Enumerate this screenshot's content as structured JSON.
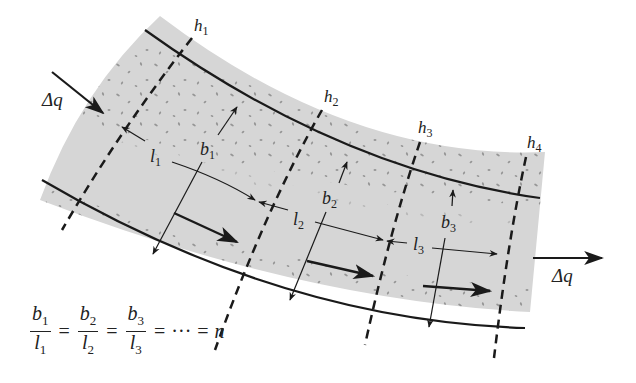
{
  "figure": {
    "type": "flow-net-element",
    "colors": {
      "soil_fill": "#d4d4d4",
      "speckle": "#8a8a8a",
      "line": "#1a1a1a",
      "background": "#ffffff"
    },
    "equipotential_labels": [
      {
        "base": "h",
        "sub": "1"
      },
      {
        "base": "h",
        "sub": "2"
      },
      {
        "base": "h",
        "sub": "3"
      },
      {
        "base": "h",
        "sub": "4"
      }
    ],
    "length_labels": [
      {
        "base": "l",
        "sub": "1"
      },
      {
        "base": "l",
        "sub": "2"
      },
      {
        "base": "l",
        "sub": "3"
      }
    ],
    "width_labels": [
      {
        "base": "b",
        "sub": "1"
      },
      {
        "base": "b",
        "sub": "2"
      },
      {
        "base": "b",
        "sub": "3"
      }
    ],
    "flow_in_label": "Δq",
    "flow_out_label": "Δq"
  },
  "equation": {
    "fractions": [
      {
        "num": "b",
        "num_sub": "1",
        "den": "l",
        "den_sub": "1"
      },
      {
        "num": "b",
        "num_sub": "2",
        "den": "l",
        "den_sub": "2"
      },
      {
        "num": "b",
        "num_sub": "3",
        "den": "l",
        "den_sub": "3"
      }
    ],
    "equals": "=",
    "ellipsis": "···",
    "result": "n"
  }
}
